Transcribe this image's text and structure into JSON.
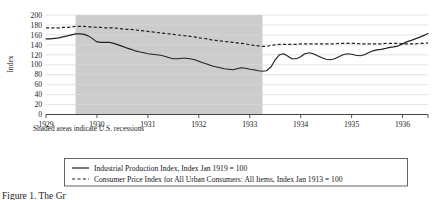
{
  "figure": {
    "note": "Shaded areas indicate U.S. recessions",
    "caption": "Figure 1. The Gr",
    "shaded_color": "#cccccc",
    "line_color": "#222222",
    "grid_color": "#d9d9d9",
    "axis_color": "#444444"
  },
  "legend": {
    "entries": [
      {
        "marker": "solid-line",
        "label": "Industrial Production Index, Index Jan 1919 = 100"
      },
      {
        "marker": "dashed-line",
        "label": "Consumer Price Index for All Urban Consumers: All Items, Index Jan 1913 = 100"
      }
    ]
  },
  "chart_data": {
    "type": "line",
    "title": "",
    "xlabel": "",
    "ylabel": "Index",
    "ylim": [
      0,
      200
    ],
    "yticks": [
      0,
      20,
      40,
      60,
      80,
      100,
      120,
      140,
      160,
      180,
      200
    ],
    "ytick_labels": [
      "0",
      "20",
      "40",
      "60",
      "80",
      "100",
      "120",
      "140",
      "160",
      "180",
      "200"
    ],
    "xlim": [
      1929.0,
      1936.5
    ],
    "xticks": [
      1929,
      1930,
      1931,
      1932,
      1933,
      1934,
      1935,
      1936
    ],
    "xtick_labels": [
      "1929",
      "1930",
      "1931",
      "1932",
      "1933",
      "1934",
      "1935",
      "1936"
    ],
    "grid": true,
    "legend_position": "below",
    "shaded_regions": [
      {
        "start": 1929.58,
        "end": 1933.25,
        "label": "U.S. recession"
      }
    ],
    "series": [
      {
        "name": "Industrial Production Index, Index Jan 1919 = 100",
        "style": "solid",
        "x": [
          1929.0,
          1929.08,
          1929.17,
          1929.25,
          1929.33,
          1929.42,
          1929.5,
          1929.58,
          1929.67,
          1929.75,
          1929.83,
          1929.92,
          1930.0,
          1930.08,
          1930.17,
          1930.25,
          1930.33,
          1930.42,
          1930.5,
          1930.58,
          1930.67,
          1930.75,
          1930.83,
          1930.92,
          1931.0,
          1931.08,
          1931.17,
          1931.25,
          1931.33,
          1931.42,
          1931.5,
          1931.58,
          1931.67,
          1931.75,
          1931.83,
          1931.92,
          1932.0,
          1932.08,
          1932.17,
          1932.25,
          1932.33,
          1932.42,
          1932.5,
          1932.58,
          1932.67,
          1932.75,
          1932.83,
          1932.92,
          1933.0,
          1933.08,
          1933.17,
          1933.25,
          1933.33,
          1933.42,
          1933.5,
          1933.58,
          1933.67,
          1933.75,
          1933.83,
          1933.92,
          1934.0,
          1934.08,
          1934.17,
          1934.25,
          1934.33,
          1934.42,
          1934.5,
          1934.58,
          1934.67,
          1934.75,
          1934.83,
          1934.92,
          1935.0,
          1935.08,
          1935.17,
          1935.25,
          1935.33,
          1935.42,
          1935.5,
          1935.58,
          1935.67,
          1935.75,
          1935.83,
          1935.92,
          1936.0,
          1936.08,
          1936.17,
          1936.25,
          1936.33,
          1936.42,
          1936.5
        ],
        "y": [
          152,
          152,
          153,
          154,
          156,
          158,
          160,
          162,
          162,
          161,
          158,
          152,
          146,
          145,
          145,
          145,
          143,
          140,
          137,
          134,
          131,
          128,
          126,
          124,
          122,
          121,
          120,
          119,
          117,
          114,
          112,
          112,
          113,
          113,
          112,
          110,
          107,
          104,
          101,
          98,
          96,
          94,
          92,
          91,
          90,
          92,
          94,
          93,
          91,
          90,
          88,
          87,
          88,
          96,
          110,
          120,
          122,
          117,
          112,
          112,
          116,
          122,
          124,
          122,
          118,
          114,
          111,
          110,
          112,
          116,
          120,
          122,
          121,
          119,
          118,
          120,
          124,
          128,
          130,
          131,
          133,
          135,
          136,
          138,
          142,
          146,
          149,
          152,
          155,
          159,
          163
        ]
      },
      {
        "name": "Consumer Price Index for All Urban Consumers: All Items, Index Jan 1913 = 100",
        "style": "dashed",
        "x": [
          1929.0,
          1929.08,
          1929.17,
          1929.25,
          1929.33,
          1929.42,
          1929.5,
          1929.58,
          1929.67,
          1929.75,
          1929.83,
          1929.92,
          1930.0,
          1930.08,
          1930.17,
          1930.25,
          1930.33,
          1930.42,
          1930.5,
          1930.58,
          1930.67,
          1930.75,
          1930.83,
          1930.92,
          1931.0,
          1931.08,
          1931.17,
          1931.25,
          1931.33,
          1931.42,
          1931.5,
          1931.58,
          1931.67,
          1931.75,
          1931.83,
          1931.92,
          1932.0,
          1932.08,
          1932.17,
          1932.25,
          1932.33,
          1932.42,
          1932.5,
          1932.58,
          1932.67,
          1932.75,
          1932.83,
          1932.92,
          1933.0,
          1933.08,
          1933.17,
          1933.25,
          1933.33,
          1933.42,
          1933.5,
          1933.58,
          1933.67,
          1933.75,
          1933.83,
          1933.92,
          1934.0,
          1934.08,
          1934.17,
          1934.25,
          1934.33,
          1934.42,
          1934.5,
          1934.58,
          1934.67,
          1934.75,
          1934.83,
          1934.92,
          1935.0,
          1935.08,
          1935.17,
          1935.25,
          1935.33,
          1935.42,
          1935.5,
          1935.58,
          1935.67,
          1935.75,
          1935.83,
          1935.92,
          1936.0,
          1936.08,
          1936.17,
          1936.25,
          1936.33,
          1936.42,
          1936.5
        ],
        "y": [
          174,
          174,
          174,
          174,
          175,
          175,
          176,
          177,
          177,
          177,
          176,
          176,
          175,
          175,
          174,
          174,
          174,
          173,
          172,
          171,
          171,
          170,
          169,
          168,
          167,
          166,
          165,
          164,
          163,
          162,
          161,
          160,
          159,
          158,
          157,
          156,
          154,
          153,
          152,
          150,
          149,
          148,
          147,
          146,
          145,
          144,
          143,
          142,
          140,
          139,
          138,
          137,
          137,
          139,
          140,
          141,
          141,
          141,
          141,
          141,
          142,
          142,
          142,
          142,
          142,
          142,
          142,
          142,
          142,
          143,
          143,
          143,
          143,
          143,
          142,
          142,
          142,
          142,
          142,
          142,
          143,
          143,
          143,
          143,
          142,
          142,
          142,
          142,
          143,
          143,
          144
        ]
      }
    ]
  }
}
